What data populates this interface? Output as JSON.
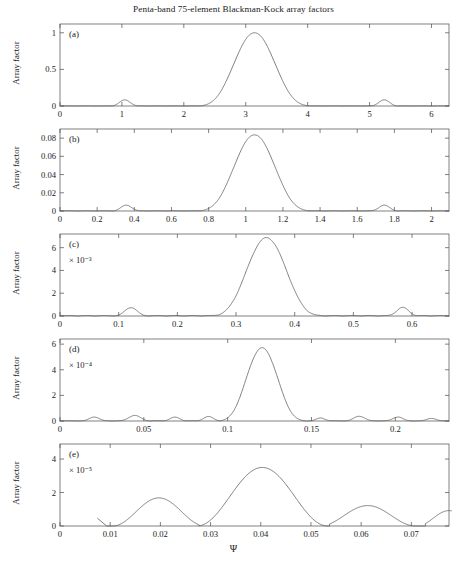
{
  "figure": {
    "title": "Penta-band 75-element Blackman-Kock array factors",
    "xlabel": "Ψ",
    "ylabel": "Array factor"
  },
  "chart_data": [
    {
      "type": "line",
      "panel": "(a)",
      "title": "Penta-band 75-element Blackman-Kock array factors",
      "xlabel": "",
      "ylabel": "Array factor",
      "exponent_label": "",
      "xlim": [
        0,
        6.283
      ],
      "ylim": [
        0,
        1.12
      ],
      "xticks": [
        0,
        1,
        2,
        3,
        4,
        5,
        6
      ],
      "xticklabels": [
        "0",
        "1",
        "2",
        "3",
        "4",
        "5",
        "6"
      ],
      "yticks": [
        0,
        0.5,
        1
      ],
      "yticklabels": [
        "0",
        "0.5",
        "1"
      ],
      "grid": false,
      "legend": "none",
      "main_lobe": {
        "center": 3.1416,
        "peak": 1.0,
        "halfwidth": 1.02
      },
      "sidelobes": [
        {
          "center": 1.047,
          "peak": 0.082,
          "halfwidth": 0.27
        },
        {
          "center": 5.236,
          "peak": 0.082,
          "halfwidth": 0.27
        }
      ],
      "ripple_amplitude": 0.004
    },
    {
      "type": "line",
      "panel": "(b)",
      "xlabel": "",
      "ylabel": "Array factor",
      "exponent_label": "",
      "xlim": [
        0,
        2.094
      ],
      "ylim": [
        0,
        0.09
      ],
      "xticks": [
        0,
        0.2,
        0.4,
        0.6,
        0.8,
        1,
        1.2,
        1.4,
        1.6,
        1.8,
        2
      ],
      "xticklabels": [
        "0",
        "0.2",
        "0.4",
        "0.6",
        "0.8",
        "1",
        "1.2",
        "1.4",
        "1.6",
        "1.8",
        "2"
      ],
      "yticks": [
        0,
        0.02,
        0.04,
        0.06,
        0.08
      ],
      "yticklabels": [
        "0",
        "0.02",
        "0.04",
        "0.06",
        "0.08"
      ],
      "grid": false,
      "legend": "none",
      "main_lobe": {
        "center": 1.047,
        "peak": 0.0835,
        "halfwidth": 0.34
      },
      "sidelobes": [
        {
          "center": 0.357,
          "peak": 0.0062,
          "halfwidth": 0.09
        },
        {
          "center": 1.745,
          "peak": 0.0062,
          "halfwidth": 0.09
        }
      ],
      "ripple_amplitude": 0.0006
    },
    {
      "type": "line",
      "panel": "(c)",
      "xlabel": "",
      "ylabel": "Array factor",
      "exponent_label": "× 10⁻³",
      "xlim": [
        0,
        0.663
      ],
      "ylim": [
        0,
        7.2
      ],
      "xticks": [
        0,
        0.1,
        0.2,
        0.3,
        0.4,
        0.5,
        0.6
      ],
      "xticklabels": [
        "0",
        "0.1",
        "0.2",
        "0.3",
        "0.4",
        "0.5",
        "0.6"
      ],
      "yticks": [
        0,
        2,
        4,
        6
      ],
      "yticklabels": [
        "0",
        "2",
        "4",
        "6"
      ],
      "grid": false,
      "legend": "none",
      "main_lobe": {
        "center": 0.352,
        "peak": 6.85,
        "halfwidth": 0.105
      },
      "sidelobes": [
        {
          "center": 0.121,
          "peak": 0.72,
          "halfwidth": 0.032
        },
        {
          "center": 0.584,
          "peak": 0.72,
          "halfwidth": 0.032
        }
      ],
      "ripple_amplitude": 0.09
    },
    {
      "type": "line",
      "panel": "(d)",
      "xlabel": "",
      "ylabel": "Array factor",
      "exponent_label": "× 10⁻⁴",
      "xlim": [
        0,
        0.232
      ],
      "ylim": [
        0,
        6.4
      ],
      "xticks": [
        0,
        0.05,
        0.1,
        0.15,
        0.2
      ],
      "xticklabels": [
        "0",
        "0.05",
        "0.1",
        "0.15",
        "0.2"
      ],
      "yticks": [
        0,
        2,
        4,
        6
      ],
      "yticklabels": [
        "0",
        "2",
        "4",
        "6"
      ],
      "grid": false,
      "legend": "none",
      "main_lobe": {
        "center": 0.1205,
        "peak": 5.7,
        "halfwidth": 0.029
      },
      "sidelobes": [
        {
          "center": 0.0205,
          "peak": 0.3,
          "halfwidth": 0.009
        },
        {
          "center": 0.0445,
          "peak": 0.42,
          "halfwidth": 0.011
        },
        {
          "center": 0.0685,
          "peak": 0.28,
          "halfwidth": 0.009
        },
        {
          "center": 0.0885,
          "peak": 0.33,
          "halfwidth": 0.009
        },
        {
          "center": 0.1555,
          "peak": 0.22,
          "halfwidth": 0.008
        },
        {
          "center": 0.1785,
          "peak": 0.36,
          "halfwidth": 0.01
        },
        {
          "center": 0.2015,
          "peak": 0.3,
          "halfwidth": 0.009
        },
        {
          "center": 0.2215,
          "peak": 0.2,
          "halfwidth": 0.008
        }
      ],
      "ripple_amplitude": 0.05
    },
    {
      "type": "line",
      "panel": "(e)",
      "xlabel": "Ψ",
      "ylabel": "Array factor",
      "exponent_label": "× 10⁻⁵",
      "xlim": [
        0,
        0.0775
      ],
      "ylim": [
        0,
        4.9
      ],
      "xticks": [
        0,
        0.01,
        0.02,
        0.03,
        0.04,
        0.05,
        0.06,
        0.07
      ],
      "xticklabels": [
        "0",
        "0.01",
        "0.02",
        "0.03",
        "0.04",
        "0.05",
        "0.06",
        "0.07"
      ],
      "yticks": [
        0,
        2,
        4
      ],
      "yticklabels": [
        "0",
        "2",
        "4"
      ],
      "grid": false,
      "legend": "none",
      "start_x": 0.0075,
      "lobes": [
        {
          "center": 0.0197,
          "peak": 1.68,
          "left_null": 0.0093,
          "right_null": 0.0277
        },
        {
          "center": 0.0403,
          "peak": 3.5,
          "left_null": 0.0277,
          "right_null": 0.0537
        },
        {
          "center": 0.0613,
          "peak": 1.22,
          "left_null": 0.0537,
          "right_null": 0.0728
        },
        {
          "center": 0.0775,
          "peak": 0.92,
          "left_null": 0.0728,
          "right_null": 0.0855
        }
      ],
      "start_segment": {
        "from_x": 0.0075,
        "from_y": 0.45,
        "to_x": 0.0093,
        "to_y": 0.0
      }
    }
  ]
}
